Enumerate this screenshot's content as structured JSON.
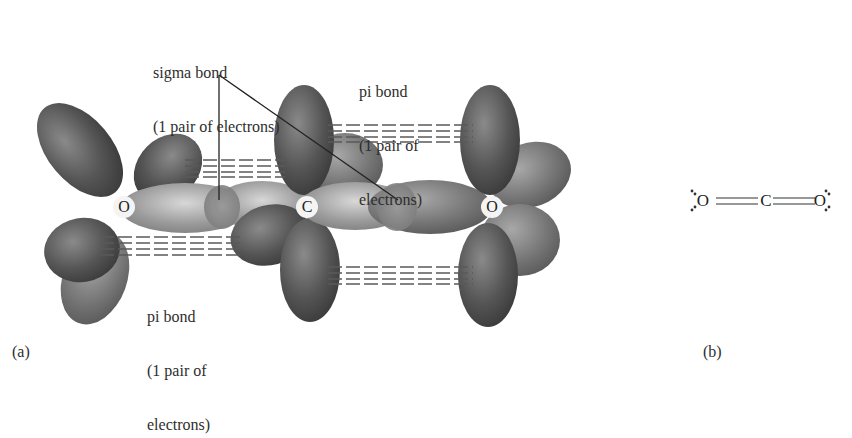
{
  "panel_a": {
    "label": "(a)",
    "atoms": {
      "left_oxygen": "O",
      "carbon": "C",
      "right_oxygen": "O"
    },
    "annotations": {
      "sigma_bond": {
        "title": "sigma bond",
        "detail": "(1 pair of electrons)"
      },
      "pi_bond_top": {
        "title": "pi bond",
        "detail_line1": "(1 pair of",
        "detail_line2": "electrons)"
      },
      "pi_bond_bottom": {
        "title": "pi bond",
        "detail_line1": "(1 pair of",
        "detail_line2": "electrons)"
      }
    }
  },
  "panel_b": {
    "label": "(b)",
    "lewis_structure": {
      "atoms": [
        "O",
        "C",
        "O"
      ],
      "bonds": [
        "double",
        "double"
      ],
      "lone_pairs_per_oxygen": 2
    }
  },
  "colors": {
    "lobe_dark": "#4a4a4a",
    "lobe_mid": "#7a7a7a",
    "lobe_light": "#c8c8c8",
    "dash": "#555555",
    "background": "#ffffff"
  }
}
